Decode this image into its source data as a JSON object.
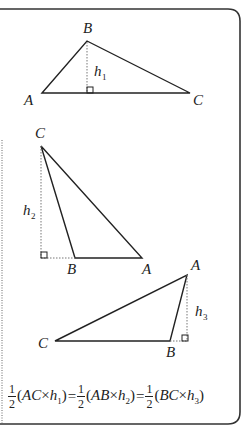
{
  "colors": {
    "stroke": "#222222",
    "frame": "#333333",
    "background": "#ffffff"
  },
  "triangle1": {
    "vertices": {
      "A": "A",
      "B": "B",
      "C": "C"
    },
    "height_label": "h",
    "height_sub": "1"
  },
  "triangle2": {
    "vertices": {
      "A": "A",
      "B": "B",
      "C": "C"
    },
    "height_label": "h",
    "height_sub": "2"
  },
  "triangle3": {
    "vertices": {
      "A": "A",
      "B": "B",
      "C": "C"
    },
    "height_label": "h",
    "height_sub": "3"
  },
  "formula": {
    "half_num": "1",
    "half_den": "2",
    "term1": {
      "open": "(",
      "base": "AC",
      "times": "×",
      "h": "h",
      "sub": "1",
      "close": ")"
    },
    "eq1": "=",
    "term2": {
      "open": "(",
      "base": "AB",
      "times": "×",
      "h": "h",
      "sub": "2",
      "close": ")"
    },
    "eq2": "=",
    "term3": {
      "open": "(",
      "base": "BC",
      "times": "×",
      "h": "h",
      "sub": "3",
      "close": ")"
    }
  }
}
